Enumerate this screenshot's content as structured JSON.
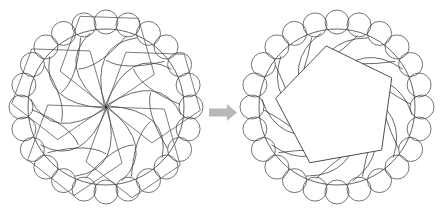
{
  "canvas": {
    "width": 447,
    "height": 222,
    "background_color": "#ffffff",
    "line_color": "#3a3a3a"
  },
  "diagram": {
    "type": "geometric-transformation",
    "title": "",
    "steps": 2,
    "symmetry_order": 5
  },
  "figures": [
    {
      "id": "left-figure",
      "name": "spiral-pentagon-rosette",
      "center_x": 106,
      "center_y": 107,
      "main_circle_radius": 78,
      "ring": {
        "count": 24,
        "orbit_radius": 85,
        "circle_radius": 12,
        "stroke_color": "#454545"
      },
      "pentagons": {
        "count": 5,
        "circumradius": 62,
        "rotation_step_deg": 72,
        "description": "five congruent pentagons sharing one common vertex at the center"
      },
      "arcs": {
        "count": 10,
        "description": "pinwheel spiral arcs sweeping from center toward the rim"
      },
      "center_dot": true
    },
    {
      "id": "right-figure",
      "name": "single-pentagon-rosette",
      "center_x": 337,
      "center_y": 107,
      "main_circle_radius": 78,
      "ring": {
        "count": 24,
        "orbit_radius": 85,
        "circle_radius": 12,
        "stroke_color": "#454545"
      },
      "pentagons": {
        "count": 1,
        "circumradius": 62,
        "rotation_deg": -10,
        "description": "one large white pentagon occupying the core"
      },
      "arcs": {
        "count": 10,
        "description": "pinwheel spiral arcs surrounding the pentagon"
      },
      "center_dot": false
    }
  ],
  "arrow": {
    "name": "transformation-arrow",
    "direction": "right",
    "color": "#b8b8b8",
    "x": 209,
    "y": 104,
    "width": 28,
    "height": 17
  }
}
